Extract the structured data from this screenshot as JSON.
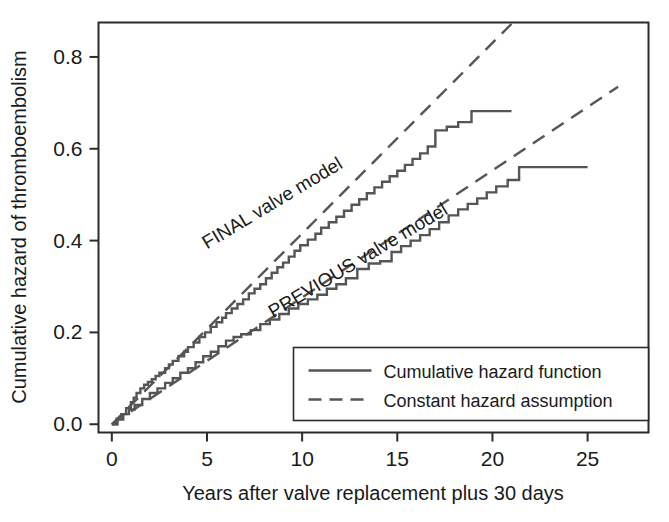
{
  "chart_data": {
    "type": "line",
    "title": "",
    "subtitle": "",
    "xlabel": "Years after valve replacement plus 30 days",
    "ylabel": "Cumulative hazard of thromboembolism",
    "xlim": [
      -0.7,
      28.2
    ],
    "ylim": [
      -0.018,
      0.875
    ],
    "xticks": [
      0,
      5,
      10,
      15,
      20,
      25
    ],
    "xticklabels": [
      "0",
      "5",
      "10",
      "15",
      "20",
      "25"
    ],
    "yticks": [
      0.0,
      0.2,
      0.4,
      0.6,
      0.8
    ],
    "yticklabels": [
      "0.0",
      "0.2",
      "0.4",
      "0.6",
      "0.8"
    ],
    "grid": false,
    "frame": "box",
    "legend_position": "lower right",
    "line_color": "#555555",
    "annotations": [
      {
        "name": "final-valve-model-label",
        "text": "FINAL valve model",
        "x": 8.6,
        "y": 0.47,
        "rotation": -31
      },
      {
        "name": "previous-valve-model-label",
        "text": "PREVIOUS valve model",
        "x": 13.1,
        "y": 0.345,
        "rotation": -31
      }
    ],
    "legend": [
      {
        "name": "cumulative-hazard-function",
        "label": "Cumulative hazard function",
        "style": "solid"
      },
      {
        "name": "constant-hazard-assumption",
        "label": "Constant hazard assumption",
        "style": "dashed"
      }
    ],
    "series": [
      {
        "name": "FINAL valve model - cumulative hazard function",
        "style": "solid",
        "type": "step",
        "x": [
          0,
          0.25,
          0.5,
          0.75,
          1.0,
          1.15,
          1.3,
          1.5,
          1.7,
          1.9,
          2.1,
          2.3,
          2.5,
          2.8,
          3.0,
          3.2,
          3.5,
          3.8,
          4.0,
          4.3,
          4.6,
          4.9,
          5.2,
          5.5,
          5.8,
          6.0,
          6.3,
          6.6,
          6.9,
          7.2,
          7.5,
          7.8,
          8.1,
          8.4,
          8.7,
          9.0,
          9.3,
          9.6,
          9.9,
          10.3,
          10.7,
          11.0,
          11.4,
          11.8,
          12.2,
          12.6,
          13.0,
          13.4,
          13.8,
          14.2,
          14.6,
          15.0,
          15.4,
          15.8,
          16.2,
          16.6,
          17.0,
          17.6,
          18.2,
          18.9,
          21.0
        ],
        "y": [
          0.0,
          0.012,
          0.022,
          0.035,
          0.048,
          0.058,
          0.068,
          0.078,
          0.086,
          0.092,
          0.098,
          0.105,
          0.112,
          0.122,
          0.13,
          0.138,
          0.148,
          0.158,
          0.168,
          0.178,
          0.19,
          0.2,
          0.212,
          0.222,
          0.232,
          0.242,
          0.252,
          0.262,
          0.272,
          0.285,
          0.295,
          0.305,
          0.318,
          0.33,
          0.342,
          0.352,
          0.365,
          0.378,
          0.39,
          0.402,
          0.415,
          0.428,
          0.44,
          0.452,
          0.465,
          0.478,
          0.49,
          0.503,
          0.516,
          0.528,
          0.54,
          0.552,
          0.565,
          0.578,
          0.59,
          0.605,
          0.64,
          0.648,
          0.658,
          0.682,
          0.682
        ]
      },
      {
        "name": "FINAL valve model - constant hazard assumption",
        "style": "dashed",
        "type": "line",
        "x": [
          0,
          21.0
        ],
        "y": [
          0.0,
          0.872
        ]
      },
      {
        "name": "PREVIOUS valve model - cumulative hazard function",
        "style": "solid",
        "type": "step",
        "x": [
          0,
          0.3,
          0.6,
          0.9,
          1.2,
          1.6,
          2.0,
          2.4,
          2.8,
          3.2,
          3.6,
          4.0,
          4.4,
          4.8,
          5.2,
          5.6,
          6.0,
          6.4,
          6.8,
          7.3,
          7.8,
          8.3,
          8.8,
          9.3,
          9.8,
          10.3,
          10.8,
          11.3,
          11.8,
          12.3,
          12.9,
          13.5,
          14.1,
          14.7,
          15.2,
          15.7,
          16.2,
          16.7,
          17.2,
          17.7,
          18.2,
          18.7,
          19.2,
          19.7,
          20.2,
          20.8,
          21.4,
          25.0
        ],
        "y": [
          0.0,
          0.01,
          0.022,
          0.032,
          0.042,
          0.055,
          0.068,
          0.078,
          0.09,
          0.1,
          0.112,
          0.122,
          0.135,
          0.148,
          0.158,
          0.17,
          0.182,
          0.19,
          0.196,
          0.205,
          0.218,
          0.228,
          0.24,
          0.252,
          0.262,
          0.272,
          0.282,
          0.295,
          0.305,
          0.318,
          0.338,
          0.35,
          0.355,
          0.375,
          0.388,
          0.4,
          0.412,
          0.425,
          0.44,
          0.455,
          0.468,
          0.48,
          0.492,
          0.505,
          0.518,
          0.532,
          0.56,
          0.56
        ]
      },
      {
        "name": "PREVIOUS valve model - constant hazard assumption",
        "style": "dashed",
        "type": "line",
        "x": [
          0,
          26.6
        ],
        "y": [
          0.0,
          0.735
        ]
      }
    ]
  }
}
